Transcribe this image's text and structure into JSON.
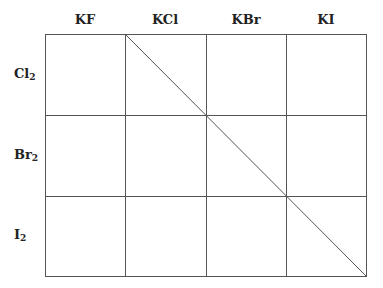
{
  "columns": [
    {
      "label": "KF"
    },
    {
      "label": "KCl"
    },
    {
      "label": "KBr"
    },
    {
      "label": "KI"
    }
  ],
  "rows": [
    {
      "base": "Cl",
      "sub": "2"
    },
    {
      "base": "Br",
      "sub": "2"
    },
    {
      "base": "I",
      "sub": "2"
    }
  ],
  "grid": {
    "x_lines": [
      45,
      125,
      206,
      286,
      366
    ],
    "y_lines": [
      34,
      115,
      196,
      276
    ],
    "diagonal": {
      "from": [
        125,
        34
      ],
      "to": [
        366,
        276
      ]
    },
    "line_color": "#555555"
  }
}
